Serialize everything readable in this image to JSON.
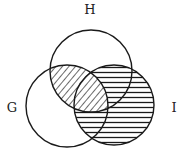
{
  "diagram": {
    "type": "venn",
    "sets": [
      {
        "id": "H",
        "label": "H",
        "cx": 91,
        "cy": 71,
        "r": 41,
        "label_x": 90,
        "label_y": 14
      },
      {
        "id": "G",
        "label": "G",
        "cx": 67,
        "cy": 106,
        "r": 41,
        "label_x": 12,
        "label_y": 112
      },
      {
        "id": "I",
        "label": "I",
        "cx": 114,
        "cy": 105,
        "r": 40,
        "label_x": 174,
        "label_y": 112
      }
    ],
    "shaded_regions": [
      {
        "region": "H ∩ G",
        "pattern": "diagonal-hatch"
      },
      {
        "region": "I − (H ∩ G)",
        "pattern": "horizontal-hatch"
      }
    ],
    "stroke_color": "#1a1a1a",
    "background": "#ffffff"
  }
}
